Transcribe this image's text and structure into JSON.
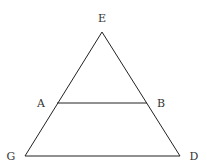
{
  "diagram": {
    "type": "geometry-triangle",
    "points": {
      "E": {
        "label": "E",
        "x": 102,
        "y": 32,
        "lx": 102,
        "ly": 22
      },
      "A": {
        "label": "A",
        "x": 57,
        "y": 103,
        "lx": 41,
        "ly": 107
      },
      "B": {
        "label": "B",
        "x": 147,
        "y": 103,
        "lx": 161,
        "ly": 107
      },
      "G": {
        "label": "G",
        "x": 25,
        "y": 156,
        "lx": 11,
        "ly": 160
      },
      "D": {
        "label": "D",
        "x": 180,
        "y": 156,
        "lx": 194,
        "ly": 160
      }
    },
    "segments": [
      {
        "from": "E",
        "to": "G"
      },
      {
        "from": "E",
        "to": "D"
      },
      {
        "from": "G",
        "to": "D"
      },
      {
        "from": "A",
        "to": "B"
      }
    ],
    "colors": {
      "line": "#222222",
      "label": "#333333",
      "background": "#ffffff"
    }
  }
}
